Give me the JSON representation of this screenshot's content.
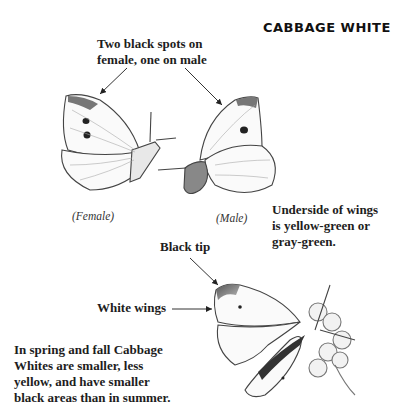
{
  "title": "CABBAGE WHITE",
  "labels": {
    "spots": [
      "Two black spots on",
      "female, one on male"
    ],
    "female_caption": "(Female)",
    "male_caption": "(Male)",
    "underside": [
      "Underside of wings",
      "is yellow-green or",
      "gray-green."
    ],
    "black_tip": "Black tip",
    "white_wings": "White wings",
    "seasonal": [
      "In spring and fall Cabbage",
      "Whites are smaller, less",
      "yellow, and have smaller",
      "black areas than in summer."
    ]
  },
  "illustrations": [
    {
      "name": "female-butterfly-side-view",
      "spots": 2
    },
    {
      "name": "male-butterfly-side-view",
      "spots": 1
    },
    {
      "name": "butterfly-on-flower-top-view"
    }
  ],
  "colors": {
    "ink": "#1d1d1d",
    "wing_shade": "#9a9a9a",
    "background": "#ffffff"
  }
}
